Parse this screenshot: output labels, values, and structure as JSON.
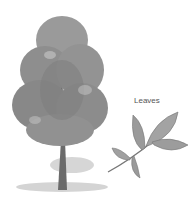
{
  "illustration": {
    "tree_label": "tree",
    "leaf_caption": "Leaves",
    "colors": {
      "foliage": "#8a8a8a",
      "foliage_dark": "#5e5e5e",
      "trunk": "#6b6b6b",
      "ground": "#c9c9c9",
      "text": "#555555"
    }
  }
}
